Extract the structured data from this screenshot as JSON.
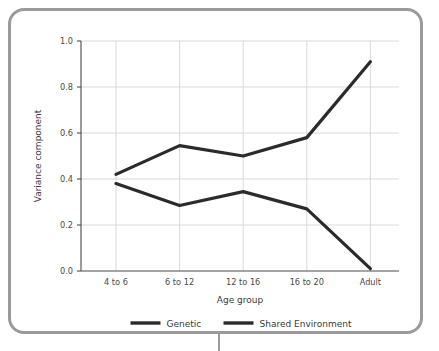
{
  "chart_data": {
    "type": "line",
    "title": "",
    "xlabel": "Age group",
    "ylabel": "Variance component",
    "categories": [
      "4 to 6",
      "6 to 12",
      "12 to 16",
      "16 to 20",
      "Adult"
    ],
    "ylim": [
      0.0,
      1.0
    ],
    "yticks": [
      "0.0",
      "0.2",
      "0.4",
      "0.6",
      "0.8",
      "1.0"
    ],
    "ytick_values": [
      0.0,
      0.2,
      0.4,
      0.6,
      0.8,
      1.0
    ],
    "grid": true,
    "legend_position": "bottom-center",
    "series": [
      {
        "name": "Genetic",
        "values": [
          0.42,
          0.545,
          0.5,
          0.58,
          0.91
        ],
        "color": "#2b2b2b"
      },
      {
        "name": "Shared Environment",
        "values": [
          0.38,
          0.285,
          0.345,
          0.27,
          0.01
        ],
        "color": "#2b2b2b"
      }
    ]
  },
  "frame": {
    "border_color": "#9a9a9a",
    "background": "#ffffff"
  }
}
